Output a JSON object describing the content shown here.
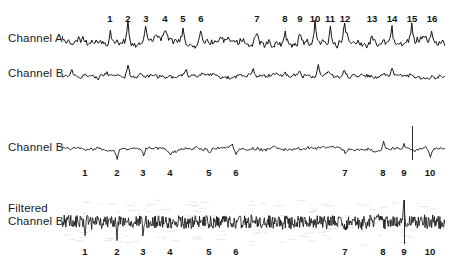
{
  "figure": {
    "background_color": "#ffffff",
    "ink_color": "#141414",
    "groups": [
      {
        "id": "group-top",
        "markers": {
          "labels": [
            "1",
            "2",
            "3",
            "4",
            "5",
            "6",
            "7",
            "8",
            "9",
            "10",
            "11",
            "12",
            "13",
            "14",
            "15",
            "16"
          ],
          "x": [
            110,
            128,
            146,
            165,
            183,
            201,
            257,
            285,
            300,
            315,
            330,
            345,
            372,
            392,
            412,
            432
          ]
        },
        "traces": [
          {
            "id": "channel-a",
            "label": "Channel A",
            "label_x": 8,
            "label_y": 38,
            "baseline_y": 41,
            "amplitude": 15,
            "roughness": "high",
            "spikes": [
              {
                "x": 110,
                "h": 12
              },
              {
                "x": 128,
                "h": 20
              },
              {
                "x": 146,
                "h": 17
              },
              {
                "x": 165,
                "h": 9
              },
              {
                "x": 183,
                "h": 11
              },
              {
                "x": 201,
                "h": 14
              },
              {
                "x": 257,
                "h": 9
              },
              {
                "x": 285,
                "h": 9
              },
              {
                "x": 300,
                "h": 11
              },
              {
                "x": 315,
                "h": 18
              },
              {
                "x": 330,
                "h": 19
              },
              {
                "x": 345,
                "h": 16
              },
              {
                "x": 372,
                "h": 9
              },
              {
                "x": 392,
                "h": 15
              },
              {
                "x": 412,
                "h": 14
              },
              {
                "x": 432,
                "h": 13
              }
            ]
          },
          {
            "id": "channel-b-raw",
            "label": "Channel B",
            "label_x": 8,
            "label_y": 72,
            "baseline_y": 76,
            "amplitude": 7,
            "roughness": "medium",
            "spikes": [
              {
                "x": 72,
                "h": 7
              },
              {
                "x": 128,
                "h": 12
              },
              {
                "x": 186,
                "h": 6
              },
              {
                "x": 253,
                "h": 6
              },
              {
                "x": 300,
                "h": 6
              },
              {
                "x": 318,
                "h": 10
              },
              {
                "x": 345,
                "h": 8
              },
              {
                "x": 392,
                "h": 6
              }
            ]
          }
        ]
      },
      {
        "id": "group-middle",
        "markers": {
          "labels": [
            "1",
            "2",
            "3",
            "4",
            "5",
            "6",
            "7",
            "8",
            "9",
            "10"
          ],
          "x": [
            85,
            117,
            143,
            170,
            209,
            236,
            345,
            383,
            404,
            430
          ]
        },
        "traces": [
          {
            "id": "channel-b-second",
            "label": "Channel B",
            "label_x": 8,
            "label_y": 146,
            "baseline_y": 150,
            "amplitude": 6,
            "roughness": "medium",
            "spikes": [
              {
                "x": 117,
                "h": -10
              },
              {
                "x": 143,
                "h": -7
              },
              {
                "x": 170,
                "h": -6
              },
              {
                "x": 209,
                "h": -5
              },
              {
                "x": 236,
                "h": -6
              },
              {
                "x": 345,
                "h": -6
              },
              {
                "x": 383,
                "h": 8
              },
              {
                "x": 404,
                "h": 6
              },
              {
                "x": 430,
                "h": -9
              }
            ],
            "vline_x": 412
          }
        ]
      },
      {
        "id": "group-bottom",
        "markers": {
          "labels": [
            "1",
            "2",
            "3",
            "4",
            "5",
            "6",
            "7",
            "8",
            "9",
            "10"
          ],
          "x": [
            85,
            117,
            143,
            170,
            209,
            236,
            345,
            383,
            404,
            430
          ]
        },
        "traces": [
          {
            "id": "filtered-channel-b",
            "label": "Filtered\nChannel B",
            "label_x": 8,
            "label_y": 208,
            "baseline_y": 222,
            "amplitude": 13,
            "roughness": "very-high",
            "spikes": [
              {
                "x": 85,
                "h": -12
              },
              {
                "x": 117,
                "h": -13
              },
              {
                "x": 143,
                "h": -12
              },
              {
                "x": 209,
                "h": -9
              },
              {
                "x": 236,
                "h": -9
              },
              {
                "x": 345,
                "h": -8
              },
              {
                "x": 404,
                "h": 24
              },
              {
                "x": 430,
                "h": -10
              }
            ],
            "vline_x": 404
          }
        ]
      }
    ]
  },
  "chart_data": {
    "type": "line",
    "title": "",
    "xlabel": "",
    "ylabel": "",
    "panels": [
      {
        "name": "Channel A",
        "marker_count": 16,
        "markers": [
          "1",
          "2",
          "3",
          "4",
          "5",
          "6",
          "7",
          "8",
          "9",
          "10",
          "11",
          "12",
          "13",
          "14",
          "15",
          "16"
        ],
        "signal": "high-amplitude spiky trace"
      },
      {
        "name": "Channel B",
        "marker_count": 0,
        "markers": [],
        "signal": "low-amplitude trace, same time base as Channel A"
      },
      {
        "name": "Channel B",
        "marker_count": 10,
        "markers": [
          "1",
          "2",
          "3",
          "4",
          "5",
          "6",
          "7",
          "8",
          "9",
          "10"
        ],
        "signal": "low-amplitude trace with downward deflections, vertical marker line between 9 and 10"
      },
      {
        "name": "Filtered Channel B",
        "marker_count": 10,
        "markers": [
          "1",
          "2",
          "3",
          "4",
          "5",
          "6",
          "7",
          "8",
          "9",
          "10"
        ],
        "signal": "dense high-frequency filtered trace with large burst at marker 9"
      }
    ]
  }
}
